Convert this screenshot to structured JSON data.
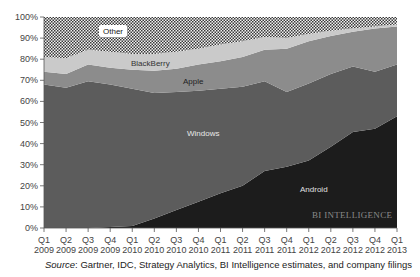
{
  "chart_data": {
    "type": "area",
    "stacked": true,
    "percent": true,
    "title": "",
    "xlabel": "",
    "ylabel": "",
    "ylim": [
      0,
      100
    ],
    "grid": false,
    "legend": "inline labels",
    "categories": [
      "Q1 2009",
      "Q2 2009",
      "Q3 2009",
      "Q4 2009",
      "Q1 2010",
      "Q2 2010",
      "Q3 2010",
      "Q4 2010",
      "Q1 2011",
      "Q2 2011",
      "Q3 2011",
      "Q4 2011",
      "Q1 2012",
      "Q2 2012",
      "Q3 2012",
      "Q4 2012",
      "Q1 2013"
    ],
    "x_tick_labels": [
      [
        "Q1",
        "2009"
      ],
      [
        "Q2",
        "2009"
      ],
      [
        "Q3",
        "2009"
      ],
      [
        "Q4",
        "2009"
      ],
      [
        "Q1",
        "2010"
      ],
      [
        "Q2",
        "2010"
      ],
      [
        "Q3",
        "2010"
      ],
      [
        "Q4",
        "2010"
      ],
      [
        "Q1",
        "2011"
      ],
      [
        "Q2",
        "2011"
      ],
      [
        "Q3",
        "2011"
      ],
      [
        "Q4",
        "2011"
      ],
      [
        "Q1",
        "2012"
      ],
      [
        "Q2",
        "2012"
      ],
      [
        "Q3",
        "2012"
      ],
      [
        "Q4",
        "2012"
      ],
      [
        "Q1",
        "2013"
      ]
    ],
    "y_tick_labels": [
      "0%",
      "10%",
      "20%",
      "30%",
      "40%",
      "50%",
      "60%",
      "70%",
      "80%",
      "90%",
      "100%"
    ],
    "series": [
      {
        "name": "Android",
        "color": "#1c1c1c",
        "label_color": "#e0e0e0",
        "values": [
          0,
          0,
          0,
          0.5,
          1,
          4.5,
          8.5,
          12.5,
          16.5,
          20,
          27,
          29,
          32,
          38.5,
          45.5,
          47,
          53
        ]
      },
      {
        "name": "Windows",
        "color": "#5c5c5c",
        "label_color": "#e8e8e8",
        "values": [
          68,
          66.5,
          69.5,
          67.5,
          65,
          59.5,
          56,
          52.5,
          49.5,
          47,
          42.5,
          35.5,
          36.5,
          34.5,
          31,
          27,
          24.5
        ]
      },
      {
        "name": "Apple",
        "color": "#8c8c8c",
        "label_color": "#222222",
        "values": [
          6,
          6.5,
          8,
          8,
          9,
          10.5,
          11,
          12.5,
          13,
          14,
          15,
          20.5,
          20,
          18,
          16.5,
          20.5,
          18
        ]
      },
      {
        "name": "BlackBerry",
        "color": "#cacaca",
        "label_color": "#333333",
        "values": [
          7,
          7.5,
          7,
          7.5,
          7.5,
          8,
          8,
          7.5,
          8,
          7.5,
          6,
          5,
          3.5,
          2.5,
          1.5,
          1,
          1
        ]
      },
      {
        "name": "Other",
        "color": "pattern-checker",
        "label_color": "#222222",
        "values": [
          19,
          19.5,
          15.5,
          16.5,
          17.5,
          17.5,
          16.5,
          15,
          13,
          11.5,
          9.5,
          10,
          8,
          6.5,
          5.5,
          4.5,
          3.5
        ]
      }
    ],
    "annotations": [
      "BI INTELLIGENCE"
    ]
  },
  "labels": {
    "other": "Other",
    "blackberry": "BlackBerry",
    "apple": "Apple",
    "windows": "Windows",
    "android": "Android",
    "watermark": "BI INTELLIGENCE"
  },
  "source": {
    "prefix": "Source",
    "text": ": Gartner, IDC, Strategy Analytics, BI Intelligence estimates, and company filings"
  }
}
